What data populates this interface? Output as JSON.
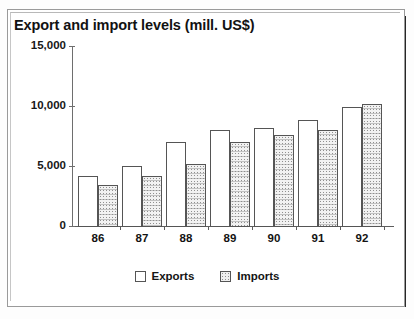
{
  "chart_data": {
    "type": "bar",
    "title": "Export and import levels (mill. US$)",
    "xlabel": "",
    "ylabel": "",
    "categories": [
      "86",
      "87",
      "88",
      "89",
      "90",
      "91",
      "92"
    ],
    "series": [
      {
        "name": "Exports",
        "values": [
          4200,
          5000,
          7000,
          8000,
          8200,
          8800,
          9900
        ]
      },
      {
        "name": "Imports",
        "values": [
          3400,
          4200,
          5200,
          7000,
          7600,
          8000,
          10200
        ]
      }
    ],
    "ylim": [
      0,
      15000
    ],
    "yticks": [
      0,
      5000,
      10000,
      15000
    ],
    "ytick_labels": [
      "0",
      "5,000",
      "10,000",
      "15,000"
    ],
    "grid": false,
    "legend": {
      "position": "bottom",
      "entries": [
        {
          "label": "Exports",
          "swatch": "white-open-square"
        },
        {
          "label": "Imports",
          "swatch": "stippled-gray-square"
        }
      ]
    },
    "colors": {
      "exports": "#ffffff",
      "imports": "#e8e8e8",
      "outline": "#555555",
      "axis": "#5d5d5d",
      "text": "#121212"
    }
  }
}
